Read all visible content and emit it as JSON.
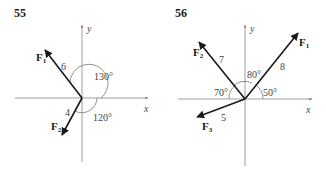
{
  "problems": [
    {
      "number": "55",
      "axes": {
        "x": "x",
        "y": "y"
      },
      "forces": [
        {
          "name": "F",
          "sub": "1",
          "magnitude": "6",
          "angle_deg": 130
        },
        {
          "name": "F",
          "sub": "2",
          "magnitude": "4",
          "angle_deg": 240
        }
      ],
      "angle_labels": [
        "130°",
        "120°"
      ]
    },
    {
      "number": "56",
      "axes": {
        "x": "x",
        "y": "y"
      },
      "forces": [
        {
          "name": "F",
          "sub": "1",
          "magnitude": "8",
          "angle_deg": 50
        },
        {
          "name": "F",
          "sub": "2",
          "magnitude": "7",
          "angle_deg": 130
        },
        {
          "name": "F",
          "sub": "3",
          "magnitude": "5",
          "angle_deg": 200
        }
      ],
      "angle_labels": [
        "80°",
        "70°",
        "50°"
      ]
    }
  ],
  "colors": {
    "axis": "#888888",
    "vector": "#1a1a1a",
    "arc": "#666666"
  }
}
